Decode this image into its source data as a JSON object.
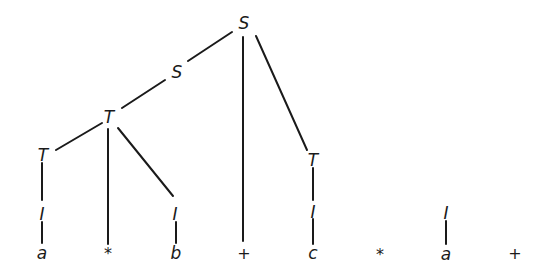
{
  "diagram": {
    "type": "parse-tree",
    "input_string": [
      "a",
      "*",
      "b",
      "+",
      "c",
      "*",
      "a",
      "+"
    ],
    "nodes": [
      {
        "id": "S_root",
        "label": "S",
        "x": 244,
        "y": 23
      },
      {
        "id": "S_mid",
        "label": "S",
        "x": 177,
        "y": 72
      },
      {
        "id": "T_mid",
        "label": "T",
        "x": 109,
        "y": 117
      },
      {
        "id": "T_left",
        "label": "T",
        "x": 43,
        "y": 155
      },
      {
        "id": "I_a1",
        "label": "I",
        "x": 42,
        "y": 214
      },
      {
        "id": "leaf_a1",
        "label": "a",
        "x": 42,
        "y": 253
      },
      {
        "id": "leaf_star1",
        "label": "*",
        "x": 108,
        "y": 254
      },
      {
        "id": "I_b",
        "label": "I",
        "x": 175,
        "y": 214
      },
      {
        "id": "leaf_b",
        "label": "b",
        "x": 176,
        "y": 253
      },
      {
        "id": "leaf_plus1",
        "label": "+",
        "x": 244,
        "y": 254
      },
      {
        "id": "T_right",
        "label": "T",
        "x": 313,
        "y": 160
      },
      {
        "id": "I_c",
        "label": "I",
        "x": 313,
        "y": 212
      },
      {
        "id": "leaf_c",
        "label": "c",
        "x": 313,
        "y": 253
      },
      {
        "id": "leaf_star2",
        "label": "*",
        "x": 380,
        "y": 255
      },
      {
        "id": "I_a2",
        "label": "I",
        "x": 446,
        "y": 213
      },
      {
        "id": "leaf_a2",
        "label": "a",
        "x": 446,
        "y": 254
      },
      {
        "id": "leaf_plus2",
        "label": "+",
        "x": 515,
        "y": 254
      }
    ],
    "edges": [
      {
        "from": "S_root",
        "to": "S_mid",
        "x1": 232,
        "y1": 32,
        "x2": 188,
        "y2": 61
      },
      {
        "from": "S_root",
        "to": "leaf_plus1",
        "x1": 243,
        "y1": 37,
        "x2": 243,
        "y2": 241
      },
      {
        "from": "S_root",
        "to": "T_right",
        "x1": 256,
        "y1": 36,
        "x2": 307,
        "y2": 150
      },
      {
        "from": "S_mid",
        "to": "T_mid",
        "x1": 165,
        "y1": 80,
        "x2": 122,
        "y2": 108
      },
      {
        "from": "T_mid",
        "to": "T_left",
        "x1": 102,
        "y1": 123,
        "x2": 56,
        "y2": 150
      },
      {
        "from": "T_mid",
        "to": "leaf_star1",
        "x1": 108,
        "y1": 129,
        "x2": 108,
        "y2": 244
      },
      {
        "from": "T_mid",
        "to": "I_b",
        "x1": 118,
        "y1": 128,
        "x2": 173,
        "y2": 196
      },
      {
        "from": "T_left",
        "to": "I_a1",
        "x1": 42,
        "y1": 163,
        "x2": 42,
        "y2": 200
      },
      {
        "from": "I_a1",
        "to": "leaf_a1",
        "x1": 42,
        "y1": 222,
        "x2": 42,
        "y2": 243
      },
      {
        "from": "I_b",
        "to": "leaf_b",
        "x1": 176,
        "y1": 222,
        "x2": 176,
        "y2": 243
      },
      {
        "from": "T_right",
        "to": "I_c",
        "x1": 313,
        "y1": 168,
        "x2": 313,
        "y2": 200
      },
      {
        "from": "I_c",
        "to": "leaf_c",
        "x1": 313,
        "y1": 219,
        "x2": 313,
        "y2": 244
      },
      {
        "from": "I_a2",
        "to": "leaf_a2",
        "x1": 446,
        "y1": 221,
        "x2": 446,
        "y2": 244
      }
    ],
    "colors": {
      "ink": "#1a1a1a",
      "background": "#ffffff"
    }
  }
}
